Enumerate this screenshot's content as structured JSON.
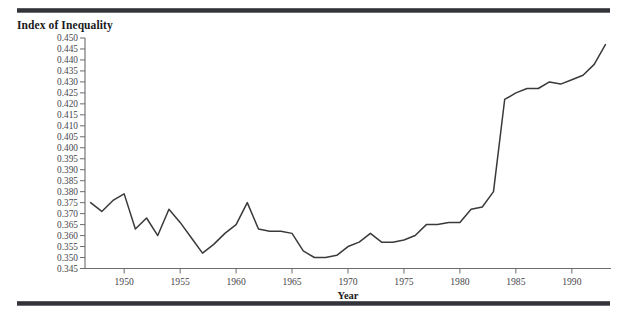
{
  "figure": {
    "title": "Index of Inequality",
    "rule_color": "#33333a",
    "line_color": "#3a3a3a",
    "axis_color": "#6b6b70",
    "text_color": "#46464b"
  },
  "chart_data": {
    "type": "line",
    "title": "Index of Inequality",
    "xlabel": "Year",
    "ylabel": "Index of Inequality",
    "xlim": [
      1946.5,
      1993.5
    ],
    "ylim": [
      0.345,
      0.45
    ],
    "grid": false,
    "legend": null,
    "xticks": [
      1950,
      1955,
      1960,
      1965,
      1970,
      1975,
      1980,
      1985,
      1990
    ],
    "xticklabels": [
      "1950",
      "1955",
      "1960",
      "1965",
      "1970",
      "1975",
      "1980",
      "1985",
      "1990"
    ],
    "yticks": [
      0.345,
      0.35,
      0.355,
      0.36,
      0.365,
      0.37,
      0.375,
      0.38,
      0.385,
      0.39,
      0.395,
      0.4,
      0.405,
      0.41,
      0.415,
      0.42,
      0.425,
      0.43,
      0.435,
      0.44,
      0.445,
      0.45
    ],
    "yticklabels": [
      "0.345",
      "0.350",
      "0.355",
      "0.360",
      "0.365",
      "0.370",
      "0.375",
      "0.380",
      "0.385",
      "0.390",
      "0.395",
      "0.400",
      "0.405",
      "0.410",
      "0.415",
      "0.420",
      "0.425",
      "0.430",
      "0.435",
      "0.440",
      "0.445",
      "0.450"
    ],
    "x": [
      1947,
      1948,
      1949,
      1950,
      1951,
      1952,
      1953,
      1954,
      1955,
      1956,
      1957,
      1958,
      1959,
      1960,
      1961,
      1962,
      1963,
      1964,
      1965,
      1966,
      1967,
      1968,
      1969,
      1970,
      1971,
      1972,
      1973,
      1974,
      1975,
      1976,
      1977,
      1978,
      1979,
      1980,
      1981,
      1982,
      1983,
      1984,
      1985,
      1986,
      1987,
      1988,
      1989,
      1990,
      1991,
      1992,
      1993
    ],
    "values": [
      0.375,
      0.371,
      0.376,
      0.379,
      0.363,
      0.368,
      0.36,
      0.372,
      0.366,
      0.359,
      0.352,
      0.356,
      0.361,
      0.365,
      0.375,
      0.363,
      0.362,
      0.362,
      0.361,
      0.353,
      0.35,
      0.35,
      0.351,
      0.355,
      0.357,
      0.361,
      0.357,
      0.357,
      0.358,
      0.36,
      0.365,
      0.365,
      0.366,
      0.366,
      0.372,
      0.373,
      0.38,
      0.422,
      0.425,
      0.427,
      0.427,
      0.43,
      0.429,
      0.431,
      0.433,
      0.438,
      0.447
    ],
    "series": [
      {
        "name": "Index of Inequality",
        "values": [
          0.375,
          0.371,
          0.376,
          0.379,
          0.363,
          0.368,
          0.36,
          0.372,
          0.366,
          0.359,
          0.352,
          0.356,
          0.361,
          0.365,
          0.375,
          0.363,
          0.362,
          0.362,
          0.361,
          0.353,
          0.35,
          0.35,
          0.351,
          0.355,
          0.357,
          0.361,
          0.357,
          0.357,
          0.358,
          0.36,
          0.365,
          0.365,
          0.366,
          0.366,
          0.372,
          0.373,
          0.38,
          0.422,
          0.425,
          0.427,
          0.427,
          0.43,
          0.429,
          0.431,
          0.433,
          0.438,
          0.447
        ]
      }
    ]
  }
}
